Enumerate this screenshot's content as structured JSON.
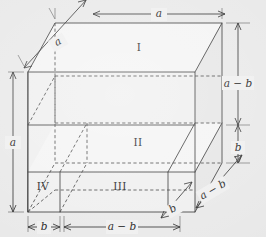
{
  "figure": {
    "background_color": "#e9e9e9",
    "edge_color": "#3a3a3a",
    "hidden_edge_color": "#4a4a4a",
    "dimension_color": "#2e2e2e",
    "face_fill_color": "#efefef"
  },
  "regions": [
    {
      "id": "I",
      "label": "I",
      "x": 139,
      "y": 48
    },
    {
      "id": "II",
      "label": "II",
      "x": 138,
      "y": 143
    },
    {
      "id": "III",
      "label": "III",
      "x": 120,
      "y": 187
    },
    {
      "id": "IV",
      "label": "IV",
      "x": 43,
      "y": 187
    }
  ],
  "dimensions": [
    {
      "id": "depth-top",
      "label": "a",
      "x": 59,
      "y": 43,
      "rotation": -30.5,
      "placement": "top-left-diagonal"
    },
    {
      "id": "width-top",
      "label": "a",
      "x": 159,
      "y": 14,
      "rotation": 0,
      "placement": "top-horizontal"
    },
    {
      "id": "height-left",
      "label": "a",
      "x": 13,
      "y": 143,
      "rotation": -90,
      "placement": "left-vertical"
    },
    {
      "id": "height-right-upper",
      "label": "a − b",
      "x": 237,
      "y": 84,
      "rotation": 0,
      "placement": "right-vertical-upper"
    },
    {
      "id": "height-right-lower",
      "label": "b",
      "x": 237,
      "y": 148,
      "rotation": 0,
      "placement": "right-vertical-lower"
    },
    {
      "id": "width-bottom-b",
      "label": "b",
      "x": 44,
      "y": 227,
      "rotation": 0,
      "placement": "bottom-horizontal-left"
    },
    {
      "id": "width-bottom-ab",
      "label": "a − b",
      "x": 122,
      "y": 227,
      "rotation": 0,
      "placement": "bottom-horizontal-right"
    },
    {
      "id": "depth-bottom-ab",
      "label": "a − b",
      "x": 213,
      "y": 190,
      "rotation": -30.5,
      "placement": "bottom-right-diagonal-outer"
    },
    {
      "id": "depth-bottom-b",
      "label": "b",
      "x": 173,
      "y": 209,
      "rotation": -30.5,
      "placement": "bottom-right-diagonal-inner"
    }
  ],
  "geometry": {
    "front_top_left": {
      "x": 28,
      "y": 72
    },
    "front_top_right": {
      "x": 195,
      "y": 72
    },
    "front_bottom_left": {
      "x": 28,
      "y": 212
    },
    "front_bottom_right": {
      "x": 195,
      "y": 212
    },
    "back_top_left": {
      "x": 55,
      "y": 23
    },
    "back_top_right": {
      "x": 222,
      "y": 23
    },
    "back_bottom_left": {
      "x": 55,
      "y": 163
    },
    "back_bottom_right": {
      "x": 222,
      "y": 163
    },
    "split_horizontal_upper_y": 125,
    "split_horizontal_lower_y": 172,
    "split_vertical_x": 60
  }
}
